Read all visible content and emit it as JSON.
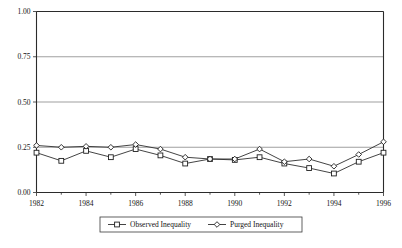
{
  "chart_data": {
    "type": "line",
    "title": "",
    "xlabel": "",
    "ylabel": "",
    "x": [
      1982,
      1983,
      1984,
      1985,
      1986,
      1987,
      1988,
      1989,
      1990,
      1991,
      1992,
      1993,
      1994,
      1995,
      1996
    ],
    "xlim": [
      1982,
      1996
    ],
    "ylim": [
      0.0,
      1.0
    ],
    "y_ticks": [
      0.0,
      0.25,
      0.5,
      0.75,
      1.0
    ],
    "y_tick_labels": [
      "0.00",
      "0.25",
      "0.50",
      "0.75",
      "1.00"
    ],
    "x_ticks": [
      1982,
      1984,
      1986,
      1988,
      1990,
      1992,
      1994,
      1996
    ],
    "x_tick_labels": [
      "1982",
      "1984",
      "1986",
      "1988",
      "1990",
      "1992",
      "1994",
      "1996"
    ],
    "x_minor_ticks": [
      1983,
      1985,
      1987,
      1989,
      1991,
      1993,
      1995
    ],
    "grid": "horizontal",
    "legend_position": "bottom-center",
    "series": [
      {
        "name": "Observed Inequality",
        "marker": "square",
        "color": "#2f2f2f",
        "values": [
          0.22,
          0.175,
          0.23,
          0.195,
          0.24,
          0.205,
          0.16,
          0.185,
          0.18,
          0.195,
          0.16,
          0.135,
          0.105,
          0.17,
          0.22
        ]
      },
      {
        "name": "Purged Inequality",
        "marker": "diamond",
        "color": "#2f2f2f",
        "values": [
          0.26,
          0.25,
          0.255,
          0.25,
          0.265,
          0.24,
          0.195,
          0.185,
          0.185,
          0.24,
          0.17,
          0.185,
          0.145,
          0.21,
          0.28
        ]
      }
    ]
  },
  "legend": {
    "items": [
      {
        "label": "Observed Inequality",
        "marker": "square-marker-icon"
      },
      {
        "label": "Purged Inequality",
        "marker": "diamond-marker-icon"
      }
    ]
  }
}
